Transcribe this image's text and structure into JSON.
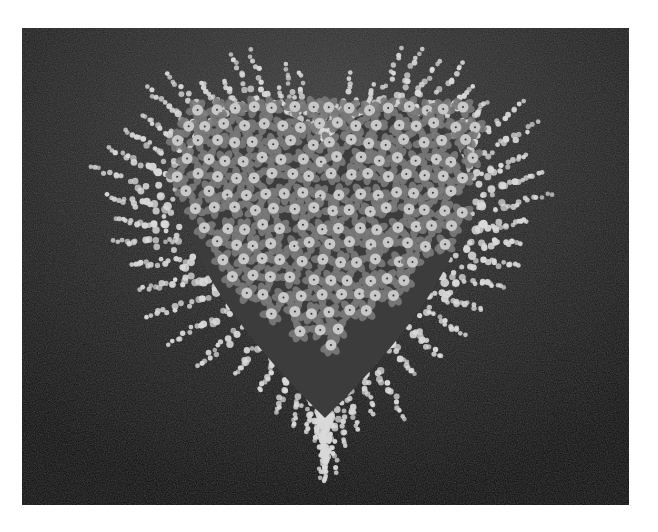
{
  "image": {
    "subject": "Heart-shaped floral arrangement",
    "description": "Black-and-white photograph of a heart-shaped wreath of clustered round-centered flowers framed by feathery white sprays on a dark textured background",
    "colors": {
      "page_background": "#ffffff",
      "photo_background": "#1a1a1a",
      "spray": "#d9d9d9",
      "flower_petal": "#7a7a7a",
      "flower_center": "#c8c8c8"
    }
  }
}
